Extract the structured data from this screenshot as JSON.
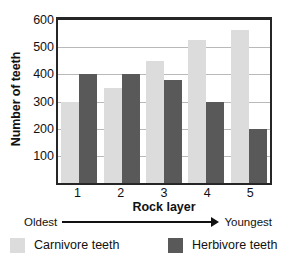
{
  "chart_data": {
    "type": "bar",
    "title": "",
    "xlabel": "Rock layer",
    "ylabel": "Number of teeth",
    "categories": [
      "1",
      "2",
      "3",
      "4",
      "5"
    ],
    "series": [
      {
        "name": "Carnivore teeth",
        "color": "#dcdcdc",
        "values": [
          300,
          350,
          450,
          525,
          565
        ]
      },
      {
        "name": "Herbivore teeth",
        "color": "#595959",
        "values": [
          400,
          400,
          380,
          300,
          200
        ]
      }
    ],
    "ylim": [
      0,
      600
    ],
    "yticks": [
      100,
      200,
      300,
      400,
      500,
      600
    ],
    "ytick_labels": [
      "100",
      "200",
      "300",
      "400",
      "500",
      "600"
    ],
    "grid": true,
    "legend_position": "bottom",
    "annotations": {
      "axis_direction_left": "Oldest",
      "axis_direction_right": "Youngest"
    }
  },
  "axis": {
    "y_title": "Number of teeth",
    "x_title": "Rock layer"
  },
  "legend": {
    "items": [
      {
        "label": "Carnivore teeth",
        "color": "#dcdcdc"
      },
      {
        "label": "Herbivore teeth",
        "color": "#595959"
      }
    ]
  },
  "direction": {
    "oldest": "Oldest",
    "youngest": "Youngest"
  }
}
